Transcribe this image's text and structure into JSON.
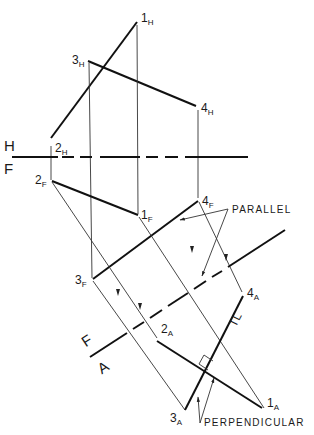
{
  "diagram": {
    "type": "descriptive-geometry-auxiliary-view",
    "reference_lines": {
      "hf": {
        "upper_label": "H",
        "lower_label": "F"
      },
      "fa": {
        "upper_label": "F",
        "lower_label": "A"
      }
    },
    "points": {
      "p1h": {
        "num": "1",
        "sub": "H"
      },
      "p2h": {
        "num": "2",
        "sub": "H"
      },
      "p3h": {
        "num": "3",
        "sub": "H"
      },
      "p4h": {
        "num": "4",
        "sub": "H"
      },
      "p1f": {
        "num": "1",
        "sub": "F"
      },
      "p2f": {
        "num": "2",
        "sub": "F"
      },
      "p3f": {
        "num": "3",
        "sub": "F"
      },
      "p4f": {
        "num": "4",
        "sub": "F"
      },
      "p1a": {
        "num": "1",
        "sub": "A"
      },
      "p2a": {
        "num": "2",
        "sub": "A"
      },
      "p3a": {
        "num": "3",
        "sub": "A"
      },
      "p4a": {
        "num": "4",
        "sub": "A"
      }
    },
    "annotations": {
      "parallel": "PARALLEL",
      "perpendicular": "PERPENDICULAR",
      "true_length": "TL"
    },
    "colors": {
      "ink": "#111111",
      "background": "#ffffff"
    }
  }
}
